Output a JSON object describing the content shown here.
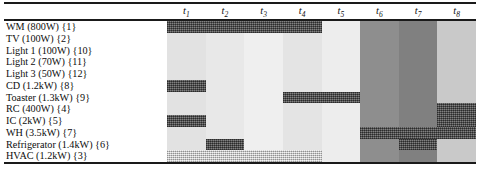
{
  "figure": {
    "kind": "appliance-scheduling-gantt",
    "caption_partial": "",
    "colors": {
      "bar_scheduled": "#595959",
      "bar_light": "#cfcfcf",
      "rule": "#1a1a1a",
      "text": "#0d0d0d"
    }
  },
  "chart_data": {
    "type": "table",
    "title": "",
    "xlabel": "",
    "ylabel": "",
    "grid": false,
    "legend": "none",
    "columns": [
      {
        "id": "t1",
        "label": "t",
        "sub": "1",
        "bg": "#e2e2e2"
      },
      {
        "id": "t2",
        "label": "t",
        "sub": "2",
        "bg": "#e8e8e8"
      },
      {
        "id": "t3",
        "label": "t",
        "sub": "3",
        "bg": "#efefef"
      },
      {
        "id": "t4",
        "label": "t",
        "sub": "4",
        "bg": "#e4e4e4"
      },
      {
        "id": "t5",
        "label": "t",
        "sub": "5",
        "bg": "#ededed"
      },
      {
        "id": "t6",
        "label": "t",
        "sub": "6",
        "bg": "#8e8e8e"
      },
      {
        "id": "t7",
        "label": "t",
        "sub": "7",
        "bg": "#808080"
      },
      {
        "id": "t8",
        "label": "t",
        "sub": "8",
        "bg": "#c9c9c9"
      }
    ],
    "rows": [
      {
        "label": "WM (800W) {1}",
        "name": "WM",
        "power": "800W",
        "id": 1,
        "bars": [
          {
            "start": 0,
            "end": 4,
            "style": "dark"
          }
        ]
      },
      {
        "label": "TV (100W) {2}",
        "name": "TV",
        "power": "100W",
        "id": 2,
        "bars": []
      },
      {
        "label": "Light 1 (100W) {10}",
        "name": "Light 1",
        "power": "100W",
        "id": 10,
        "bars": []
      },
      {
        "label": "Light 2 (70W) {11}",
        "name": "Light 2",
        "power": "70W",
        "id": 11,
        "bars": []
      },
      {
        "label": "Light 3 (50W) {12}",
        "name": "Light 3",
        "power": "50W",
        "id": 12,
        "bars": []
      },
      {
        "label": "CD (1.2kW) {8}",
        "name": "CD",
        "power": "1.2kW",
        "id": 8,
        "bars": [
          {
            "start": 0,
            "end": 1,
            "style": "dark"
          }
        ]
      },
      {
        "label": "Toaster (1.3kW) {9}",
        "name": "Toaster",
        "power": "1.3kW",
        "id": 9,
        "bars": [
          {
            "start": 3,
            "end": 5,
            "style": "dark"
          }
        ]
      },
      {
        "label": "RC (400W) {4}",
        "name": "RC",
        "power": "400W",
        "id": 4,
        "bars": [
          {
            "start": 7,
            "end": 8,
            "style": "dark"
          }
        ]
      },
      {
        "label": "IC (2kW) {5}",
        "name": "IC",
        "power": "2kW",
        "id": 5,
        "bars": [
          {
            "start": 0,
            "end": 1,
            "style": "dark"
          },
          {
            "start": 7,
            "end": 8,
            "style": "dark"
          }
        ]
      },
      {
        "label": "WH (3.5kW) {7}",
        "name": "WH",
        "power": "3.5kW",
        "id": 7,
        "bars": [
          {
            "start": 5,
            "end": 8,
            "style": "dark"
          }
        ]
      },
      {
        "label": "Refrigerator (1.4kW) {6}",
        "name": "Refrigerator",
        "power": "1.4kW",
        "id": 6,
        "bars": [
          {
            "start": 1,
            "end": 2,
            "style": "dark"
          },
          {
            "start": 6,
            "end": 7,
            "style": "dark"
          }
        ]
      },
      {
        "label": "HVAC (1.2kW) {3}",
        "name": "HVAC",
        "power": "1.2kW",
        "id": 3,
        "bars": [
          {
            "start": 0,
            "end": 4,
            "style": "light"
          }
        ]
      }
    ]
  }
}
